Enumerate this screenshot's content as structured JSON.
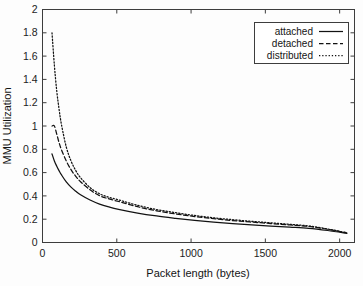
{
  "chart_data": {
    "type": "line",
    "title": "",
    "xlabel": "Packet length (bytes)",
    "ylabel": "MMU Utilization",
    "xlim": [
      0,
      2100
    ],
    "ylim": [
      0,
      2
    ],
    "grid": false,
    "legend_position": "top-right",
    "xticks": [
      0,
      500,
      1000,
      1500,
      2000
    ],
    "xtick_labels": [
      "0",
      "500",
      "1000",
      "1500",
      "2000"
    ],
    "yticks": [
      0,
      0.2,
      0.4,
      0.6,
      0.8,
      1,
      1.2,
      1.4,
      1.6,
      1.8,
      2
    ],
    "ytick_labels": [
      "0",
      "0.2",
      "0.4",
      "0.6",
      "0.8",
      "1",
      "1.2",
      "1.4",
      "1.6",
      "1.8",
      "2"
    ],
    "x": [
      64,
      80,
      96,
      112,
      128,
      160,
      192,
      224,
      256,
      320,
      384,
      448,
      512,
      640,
      768,
      896,
      1024,
      1152,
      1280,
      1408,
      1536,
      1664,
      1792,
      1920,
      2048
    ],
    "series": [
      {
        "name": "attached",
        "style": "solid",
        "values": [
          0.76,
          0.7,
          0.655,
          0.615,
          0.58,
          0.52,
          0.475,
          0.44,
          0.41,
          0.365,
          0.33,
          0.305,
          0.285,
          0.253,
          0.228,
          0.208,
          0.19,
          0.175,
          0.162,
          0.151,
          0.141,
          0.132,
          0.122,
          0.103,
          0.079
        ]
      },
      {
        "name": "detached",
        "style": "dashed",
        "values": [
          1.0,
          1.0,
          0.93,
          0.855,
          0.795,
          0.7,
          0.625,
          0.568,
          0.522,
          0.452,
          0.402,
          0.374,
          0.352,
          0.307,
          0.272,
          0.245,
          0.223,
          0.204,
          0.188,
          0.175,
          0.163,
          0.151,
          0.138,
          0.113,
          0.082
        ]
      },
      {
        "name": "distributed",
        "style": "dotted",
        "values": [
          1.8,
          1.52,
          1.3,
          1.14,
          1.01,
          0.82,
          0.7,
          0.617,
          0.556,
          0.472,
          0.418,
          0.388,
          0.366,
          0.319,
          0.283,
          0.256,
          0.232,
          0.212,
          0.196,
          0.182,
          0.169,
          0.156,
          0.142,
          0.116,
          0.084
        ]
      }
    ]
  },
  "legend": {
    "entries": [
      {
        "label": "attached"
      },
      {
        "label": "detached"
      },
      {
        "label": "distributed"
      }
    ]
  }
}
